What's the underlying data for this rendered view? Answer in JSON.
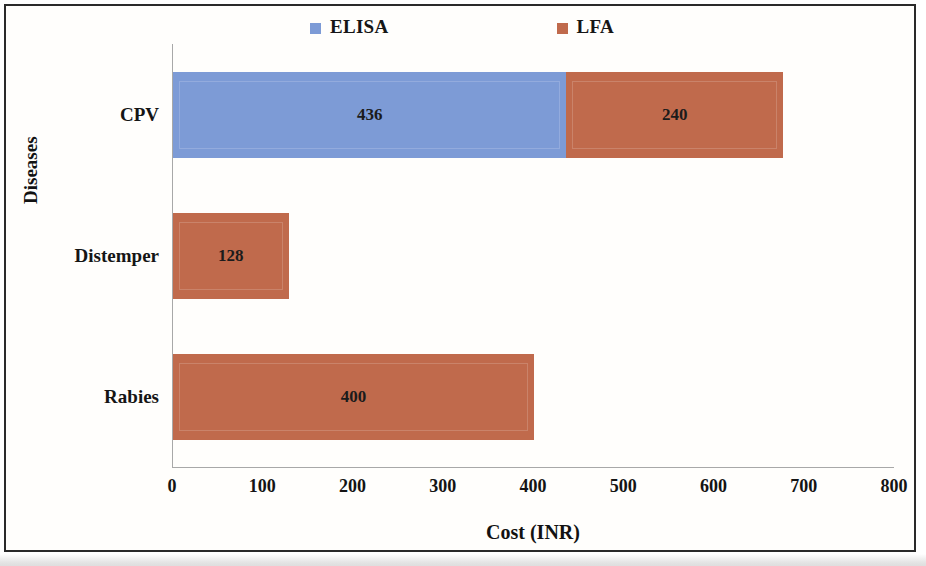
{
  "chart_data": {
    "type": "bar",
    "orientation": "horizontal",
    "stacked": true,
    "title": "",
    "xlabel": "Cost (INR)",
    "ylabel": "Diseases",
    "categories": [
      "CPV",
      "Distemper",
      "Rabies"
    ],
    "series": [
      {
        "name": "ELISA",
        "color": "#7d9bd6",
        "values": [
          436,
          0,
          0
        ],
        "labels": [
          "436",
          "",
          ""
        ]
      },
      {
        "name": "LFA",
        "color": "#c06a4c",
        "values": [
          240,
          128,
          400
        ],
        "labels": [
          "240",
          "128",
          "400"
        ]
      }
    ],
    "xlim": [
      0,
      800
    ],
    "xticks": [
      0,
      100,
      200,
      300,
      400,
      500,
      600,
      700,
      800
    ],
    "xtick_labels": [
      "0",
      "100",
      "200",
      "300",
      "400",
      "500",
      "600",
      "700",
      "800"
    ],
    "grid": false,
    "legend_position": "top"
  },
  "legend": {
    "entries": [
      {
        "label": "ELISA",
        "swatch": "legend-swatch-elisa",
        "color": "#7d9bd6"
      },
      {
        "label": "LFA",
        "swatch": "legend-swatch-lfa",
        "color": "#c06a4c"
      }
    ]
  },
  "axes": {
    "y_title": "Diseases",
    "x_title": "Cost (INR)"
  }
}
